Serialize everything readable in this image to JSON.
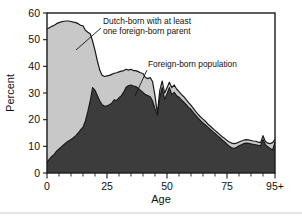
{
  "chart_data": {
    "type": "area",
    "title": "",
    "subtitle": "",
    "xlabel": "Age",
    "ylabel": "Percent",
    "xlim": [
      0,
      95
    ],
    "ylim": [
      0,
      60
    ],
    "grid": false,
    "stacked": false,
    "legend_position": "inline-annotations",
    "x_tick_labels": [
      "0",
      "25",
      "50",
      "75",
      "95+"
    ],
    "x_tick_values": [
      0,
      25,
      50,
      75,
      95
    ],
    "x_minor_tick_step": 5,
    "y_tick_labels": [
      "0",
      "10",
      "20",
      "30",
      "40",
      "50",
      "60"
    ],
    "y_tick_values": [
      0,
      10,
      20,
      30,
      40,
      50,
      60
    ],
    "colors": {
      "upper_area": "#c8c8c8",
      "lower_area": "#3c3c3c",
      "outline": "#1a1a1a",
      "axis": "#1a1a1a",
      "background": "#ffffff"
    },
    "annotations": [
      {
        "name": "upper-series-label",
        "text_line1": "Dutch-born with at least",
        "text_line2": "one foreign-born parent",
        "text": "Dutch-born with at least one foreign-born parent",
        "x": 33,
        "y": 52
      },
      {
        "name": "lower-series-label",
        "text": "Foreign-born population",
        "x": 53,
        "y": 41
      }
    ],
    "x": [
      0,
      1,
      2,
      3,
      4,
      5,
      6,
      7,
      8,
      9,
      10,
      11,
      12,
      13,
      14,
      15,
      16,
      17,
      18,
      19,
      20,
      21,
      22,
      23,
      24,
      25,
      26,
      27,
      28,
      29,
      30,
      31,
      32,
      33,
      34,
      35,
      36,
      37,
      38,
      39,
      40,
      41,
      42,
      43,
      44,
      45,
      46,
      47,
      48,
      49,
      50,
      51,
      52,
      53,
      54,
      55,
      56,
      57,
      58,
      59,
      60,
      61,
      62,
      63,
      64,
      65,
      66,
      67,
      68,
      69,
      70,
      71,
      72,
      73,
      74,
      75,
      76,
      77,
      78,
      79,
      80,
      81,
      82,
      83,
      84,
      85,
      86,
      87,
      88,
      89,
      90,
      91,
      92,
      93,
      94,
      95
    ],
    "series": [
      {
        "name": "Dutch-born with at least one foreign-born parent",
        "note": "upper boundary curve; light gray band lies between this curve and the foreign-born curve",
        "color": "#c8c8c8",
        "values": [
          54.0,
          54.5,
          55.0,
          55.4,
          56.0,
          56.4,
          56.7,
          56.9,
          57.0,
          57.0,
          56.8,
          56.6,
          56.4,
          56.0,
          55.4,
          55.2,
          53.5,
          52.8,
          52.2,
          49.5,
          46.0,
          42.0,
          38.5,
          36.6,
          36.2,
          36.4,
          36.6,
          37.0,
          37.4,
          37.6,
          37.9,
          38.2,
          38.4,
          38.9,
          38.6,
          38.9,
          38.4,
          38.4,
          38.0,
          37.6,
          37.3,
          35.8,
          35.4,
          35.8,
          34.2,
          29.0,
          22.2,
          31.0,
          34.5,
          30.0,
          32.0,
          34.0,
          32.0,
          33.0,
          31.5,
          30.5,
          29.5,
          28.6,
          27.5,
          26.4,
          25.4,
          24.2,
          23.0,
          22.0,
          21.0,
          20.2,
          19.4,
          18.4,
          17.6,
          16.8,
          16.0,
          15.2,
          14.4,
          13.6,
          13.0,
          12.2,
          11.6,
          11.2,
          11.0,
          11.2,
          11.6,
          12.0,
          12.3,
          12.5,
          12.4,
          12.2,
          12.0,
          11.9,
          11.6,
          11.4,
          14.0,
          11.8,
          11.2,
          11.0,
          11.4,
          12.6
        ]
      },
      {
        "name": "Foreign-born population",
        "note": "lower dark-filled area measured from zero",
        "color": "#3c3c3c",
        "values": [
          4.0,
          5.2,
          6.2,
          7.0,
          8.2,
          9.0,
          9.8,
          10.6,
          11.4,
          12.0,
          12.6,
          13.2,
          14.0,
          15.0,
          16.2,
          17.2,
          19.5,
          23.0,
          27.0,
          32.0,
          31.0,
          29.0,
          27.0,
          25.6,
          25.0,
          25.2,
          25.6,
          26.2,
          27.4,
          27.2,
          28.2,
          29.0,
          30.4,
          32.2,
          32.8,
          33.0,
          32.6,
          32.4,
          31.8,
          31.0,
          30.2,
          29.4,
          29.0,
          28.6,
          27.0,
          24.0,
          21.6,
          28.4,
          32.0,
          27.6,
          29.6,
          32.0,
          29.4,
          30.2,
          29.0,
          28.4,
          27.4,
          26.6,
          25.6,
          24.6,
          23.8,
          22.6,
          21.6,
          20.6,
          19.6,
          18.8,
          18.0,
          17.2,
          16.4,
          15.6,
          14.8,
          14.0,
          13.2,
          12.4,
          11.6,
          10.8,
          10.0,
          9.4,
          9.2,
          9.6,
          10.2,
          10.6,
          11.0,
          11.2,
          11.1,
          10.9,
          10.7,
          10.6,
          10.4,
          10.2,
          12.6,
          10.6,
          9.8,
          9.2,
          8.6,
          11.6
        ]
      }
    ]
  }
}
